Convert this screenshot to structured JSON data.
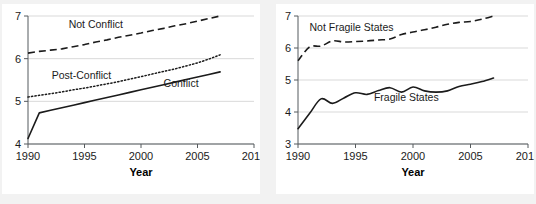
{
  "figure": {
    "background": "#f2f2f2",
    "panel_background": "#ffffff",
    "line_color": "#1b1b1b",
    "grid_color": "#d9d9d9",
    "axis_color": "#555a5e"
  },
  "chart_data": [
    {
      "type": "line",
      "panel": "left",
      "title": "",
      "xlabel": "Year",
      "ylabel": "",
      "xlim": [
        1990,
        2010
      ],
      "ylim": [
        4,
        7
      ],
      "xticks": [
        1990,
        1995,
        2000,
        2005,
        2010
      ],
      "xtick_labels": [
        "1990",
        "1995",
        "2000",
        "2005",
        "2010"
      ],
      "yticks": [
        4,
        5,
        6,
        7
      ],
      "ytick_labels": [
        "4",
        "5",
        "6",
        "7"
      ],
      "grid": "horizontal",
      "legend": "inline-annotations",
      "series": [
        {
          "name": "Not Conflict",
          "style": "dashed",
          "label_x": 1993.6,
          "label_y": 6.72,
          "x": [
            1990,
            1991,
            1992,
            1993,
            1994,
            1995,
            1996,
            1997,
            1998,
            1999,
            2000,
            2001,
            2002,
            2003,
            2004,
            2005,
            2006,
            2007
          ],
          "values": [
            6.13,
            6.17,
            6.2,
            6.23,
            6.28,
            6.33,
            6.39,
            6.44,
            6.5,
            6.55,
            6.6,
            6.66,
            6.71,
            6.77,
            6.82,
            6.88,
            6.94,
            7.0
          ]
        },
        {
          "name": "Post-Conflict",
          "style": "dotted",
          "label_x": 1992.1,
          "label_y": 5.52,
          "x": [
            1990,
            1991,
            1992,
            1993,
            1994,
            1995,
            1996,
            1997,
            1998,
            1999,
            2000,
            2001,
            2002,
            2003,
            2004,
            2005,
            2006,
            2007
          ],
          "values": [
            5.1,
            5.14,
            5.18,
            5.22,
            5.27,
            5.31,
            5.36,
            5.41,
            5.46,
            5.52,
            5.58,
            5.64,
            5.7,
            5.76,
            5.83,
            5.9,
            5.99,
            6.09
          ]
        },
        {
          "name": "Conflict",
          "style": "solid",
          "label_x": 2002.0,
          "label_y": 5.33,
          "x": [
            1990,
            1991,
            1992,
            1993,
            1994,
            1995,
            1996,
            1997,
            1998,
            1999,
            2000,
            2001,
            2002,
            2003,
            2004,
            2005,
            2006,
            2007
          ],
          "values": [
            4.13,
            4.73,
            4.79,
            4.85,
            4.91,
            4.97,
            5.03,
            5.09,
            5.15,
            5.21,
            5.27,
            5.33,
            5.39,
            5.45,
            5.51,
            5.57,
            5.63,
            5.69
          ]
        }
      ]
    },
    {
      "type": "line",
      "panel": "right",
      "title": "",
      "xlabel": "Year",
      "ylabel": "",
      "xlim": [
        1990,
        2010
      ],
      "ylim": [
        3,
        7
      ],
      "xticks": [
        1990,
        1995,
        2000,
        2005,
        2010
      ],
      "xtick_labels": [
        "1990",
        "1995",
        "2000",
        "2005",
        "2010"
      ],
      "yticks": [
        3,
        4,
        5,
        6,
        7
      ],
      "ytick_labels": [
        "3",
        "4",
        "5",
        "6",
        "7"
      ],
      "grid": "horizontal",
      "legend": "inline-annotations",
      "series": [
        {
          "name": "Not Fragile States",
          "style": "dashed",
          "label_x": 1991.0,
          "label_y": 6.52,
          "x": [
            1990,
            1991,
            1992,
            1993,
            1994,
            1995,
            1996,
            1997,
            1998,
            1999,
            2000,
            2001,
            2002,
            2003,
            2004,
            2005,
            2006,
            2007
          ],
          "values": [
            5.6,
            6.03,
            6.06,
            6.22,
            6.19,
            6.2,
            6.22,
            6.25,
            6.28,
            6.42,
            6.5,
            6.57,
            6.65,
            6.74,
            6.8,
            6.83,
            6.9,
            7.0
          ]
        },
        {
          "name": "Fragile States",
          "style": "solid",
          "label_x": 1996.6,
          "label_y": 4.33,
          "x": [
            1990,
            1991,
            1992,
            1993,
            1994,
            1995,
            1996,
            1997,
            1998,
            1999,
            2000,
            2001,
            2002,
            2003,
            2004,
            2005,
            2006,
            2007
          ],
          "values": [
            3.48,
            3.95,
            4.41,
            4.27,
            4.44,
            4.6,
            4.55,
            4.67,
            4.76,
            4.62,
            4.78,
            4.66,
            4.62,
            4.66,
            4.8,
            4.87,
            4.95,
            5.06
          ]
        }
      ]
    }
  ]
}
